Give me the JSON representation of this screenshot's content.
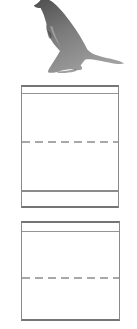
{
  "document": {
    "kind": "handwriting-practice-worksheet",
    "background_color": "#ffffff"
  },
  "illustration": {
    "name": "kangaroo",
    "description": "Grayscale photograph of a standing kangaroo facing left with long tail extending to the right, top of head cropped by page edge",
    "body_dark": "#4e4e4e",
    "body_mid": "#7a7a7a",
    "body_light": "#a0a0a0"
  },
  "writing_boxes": {
    "count": 2,
    "border_color": "#8a8a8a",
    "border_emphasis_color": "#757575",
    "top_guide_color": "#949494",
    "mid_guide_color": "#a8a8a8",
    "base_guide_color": "#8c8c8c",
    "mid_guide_style": "dashed",
    "boxes": [
      {
        "id": "writing-box-1",
        "guides": [
          "top-line",
          "dashed-midline",
          "baseline"
        ]
      },
      {
        "id": "writing-box-2",
        "guides": [
          "top-line",
          "dashed-midline"
        ]
      }
    ]
  }
}
